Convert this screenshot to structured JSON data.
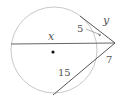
{
  "diagram": {
    "type": "circle-secant-tangent",
    "labels": {
      "x": "x",
      "y": "y",
      "five": "5",
      "seven": "7",
      "fifteen": "15"
    },
    "colors": {
      "circle": "#c8c8c8",
      "lines": "#555555",
      "center": "#111111"
    }
  }
}
